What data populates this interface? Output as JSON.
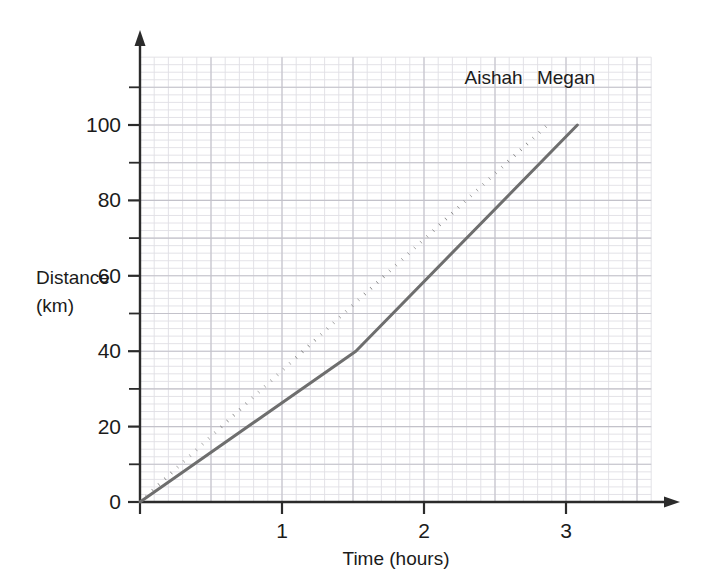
{
  "chart_data": {
    "type": "line",
    "title": "",
    "xlabel": "Time (hours)",
    "ylabel_line1": "Distance",
    "ylabel_line2": "(km)",
    "xlim": [
      0,
      3.6
    ],
    "ylim": [
      0,
      118
    ],
    "xticks": [
      1,
      2,
      3
    ],
    "xtick_labels": [
      "1",
      "2",
      "3"
    ],
    "yticks": [
      0,
      20,
      40,
      60,
      80,
      100
    ],
    "ytick_labels": [
      "0",
      "20",
      "40",
      "60",
      "80",
      "100"
    ],
    "y_minor_ticks": [
      10,
      30,
      50,
      70,
      90,
      110
    ],
    "grid": true,
    "grid_minor_step_x": 0.1,
    "grid_minor_step_y": 2,
    "grid_major_step_x": 0.5,
    "grid_major_step_y": 10,
    "legend_position": "inline-end-of-line",
    "series": [
      {
        "name": "Aishah",
        "style": "dotted",
        "color": "#6e6e6e",
        "points": [
          {
            "x": 0,
            "y": 0
          },
          {
            "x": 2.87,
            "y": 100
          }
        ],
        "label_x": 2.49,
        "label_y": 111
      },
      {
        "name": "Megan",
        "style": "solid",
        "color": "#6e6e6e",
        "points": [
          {
            "x": 0,
            "y": 0
          },
          {
            "x": 1.52,
            "y": 40
          },
          {
            "x": 3.08,
            "y": 100
          }
        ],
        "label_x": 3.0,
        "label_y": 111
      }
    ]
  },
  "colors": {
    "axis": "#2b2b2b",
    "series": "#6e6e6e",
    "grid_minor": "#e0dfe4",
    "grid_major": "#c3c2ca",
    "text": "#1b1b1b",
    "background": "#ffffff"
  }
}
